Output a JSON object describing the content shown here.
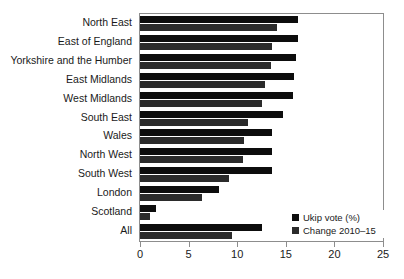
{
  "chart_data": {
    "type": "bar",
    "orientation": "horizontal",
    "title": "",
    "subtitle": "",
    "xlabel": "",
    "ylabel": "",
    "xlim": [
      0,
      25
    ],
    "xticks": [
      0,
      5,
      10,
      15,
      20,
      25
    ],
    "xtick_labels": [
      "0",
      "5",
      "10",
      "15",
      "20",
      "25"
    ],
    "grid": false,
    "legend_position": "bottom-right",
    "categories": [
      "North East",
      "East of England",
      "Yorkshire and the Humber",
      "East Midlands",
      "West Midlands",
      "South East",
      "Wales",
      "North West",
      "South West",
      "London",
      "Scotland",
      "All"
    ],
    "series": [
      {
        "name": "Ukip vote (%)",
        "color": "#0d0d0d",
        "values": [
          16.3,
          16.3,
          16.1,
          15.8,
          15.7,
          14.7,
          13.6,
          13.6,
          13.6,
          8.1,
          1.6,
          12.6
        ]
      },
      {
        "name": "Change 2010–15",
        "color": "#2b2b2b",
        "values": [
          14.1,
          13.6,
          13.5,
          12.9,
          12.5,
          11.1,
          10.7,
          10.6,
          9.2,
          6.4,
          1.0,
          9.5
        ]
      }
    ]
  },
  "legend": {
    "items": [
      {
        "label": "Ukip vote (%)"
      },
      {
        "label": "Change 2010–15"
      }
    ]
  }
}
